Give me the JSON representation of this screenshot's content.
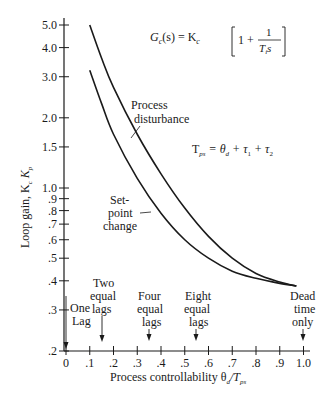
{
  "chart_data": {
    "type": "line",
    "title": "",
    "xlabel": "Process controllability θd/Tps",
    "ylabel": "Loop gain, Kc Kp",
    "yscale": "log",
    "xlim": [
      0,
      1.0
    ],
    "ylim": [
      0.2,
      5.0
    ],
    "grid": false,
    "x_ticks": [
      "0",
      ".1",
      ".2",
      ".3",
      ".4",
      ".5",
      ".6",
      ".7",
      ".8",
      ".9",
      "1.0"
    ],
    "y_ticks": [
      "5.0",
      "4.0",
      "3.0",
      "2.0",
      "1.5",
      "1.0",
      ".9",
      ".8",
      ".7",
      ".6",
      ".5",
      ".4",
      ".3",
      ".2"
    ],
    "series": [
      {
        "name": "Process disturbance",
        "x": [
          0.1,
          0.15,
          0.2,
          0.3,
          0.4,
          0.5,
          0.6,
          0.7,
          0.8,
          0.9,
          0.97
        ],
        "y": [
          5.0,
          3.6,
          2.7,
          1.7,
          1.15,
          0.82,
          0.62,
          0.5,
          0.43,
          0.395,
          0.38
        ]
      },
      {
        "name": "Set-point change",
        "x": [
          0.1,
          0.15,
          0.2,
          0.3,
          0.4,
          0.5,
          0.6,
          0.7,
          0.8,
          0.9,
          0.97
        ],
        "y": [
          3.2,
          2.3,
          1.7,
          1.1,
          0.78,
          0.6,
          0.5,
          0.44,
          0.41,
          0.39,
          0.38
        ]
      }
    ],
    "annotations": [
      {
        "text": "Gc(s) = Kc [1 + 1/(Ti s)]",
        "position": "top-right"
      },
      {
        "text": "Tps = θd + τ1 + τ2",
        "position": "right"
      },
      {
        "text": "One Lag",
        "x": 0.0
      },
      {
        "text": "Two equal lags",
        "x": 0.15
      },
      {
        "text": "Four equal lags",
        "x": 0.35
      },
      {
        "text": "Eight equal lags",
        "x": 0.55
      },
      {
        "text": "Dead time only",
        "x": 1.0
      }
    ]
  },
  "labels": {
    "formula_lhs": "G",
    "formula_lhs_sub": "c",
    "formula_mid": "(s) = K",
    "formula_mid_sub": "c",
    "formula_one": "1 +",
    "formula_num": "1",
    "formula_den": "T",
    "formula_den_sub": "i",
    "formula_den_s": "s",
    "tps_lhs": "T",
    "tps_lhs_sub": "ps",
    "tps_rhs": "= θ",
    "tps_rhs_sub1": "d",
    "tps_plus1": "+ τ",
    "tps_sub2": "1",
    "tps_plus2": "+ τ",
    "tps_sub3": "2",
    "curve1_line1": "Process",
    "curve1_line2": "disturbance",
    "curve2_line1": "Set-",
    "curve2_line2": "point",
    "curve2_line3": "change",
    "one_lag_1": "One",
    "one_lag_2": "Lag",
    "two_1": "Two",
    "two_2": "equal",
    "two_3": "lags",
    "four_1": "Four",
    "four_2": "equal",
    "four_3": "lags",
    "eight_1": "Eight",
    "eight_2": "equal",
    "eight_3": "lags",
    "dead_1": "Dead",
    "dead_2": "time",
    "dead_3": "only",
    "xlabel_main": "Process controllability θ",
    "xlabel_sub": "d",
    "xlabel_tail": "/T",
    "xlabel_sub2": "ps",
    "ylabel_main": "Loop gain, K",
    "ylabel_sub1": "c",
    "ylabel_mid": " K",
    "ylabel_sub2": "p"
  }
}
